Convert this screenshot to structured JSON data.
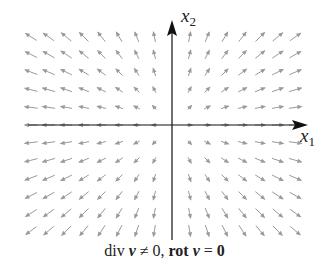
{
  "figure": {
    "x_axis_label": "x",
    "x_axis_subscript": "1",
    "y_axis_label": "x",
    "y_axis_subscript": "2",
    "caption": {
      "part1": "div ",
      "v1": "v",
      "part2": " ≠ 0, ",
      "rot": "rot",
      "v2": "v",
      "part3": " = ",
      "zero": "0"
    }
  },
  "field": {
    "type": "radial-source",
    "origin_px": [
      172,
      125
    ],
    "spacing_px": 17.6,
    "cols": 15,
    "rows": 12,
    "arrow_color": "#9a9a9a",
    "axis_color": "#111111"
  }
}
